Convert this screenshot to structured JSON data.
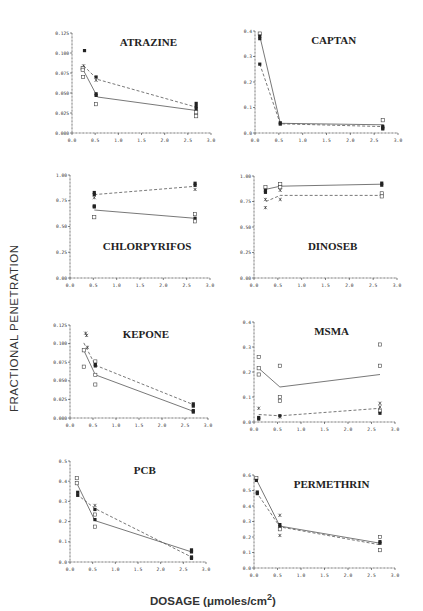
{
  "figure": {
    "ylabel": "FRACTIONAL PENETRATION",
    "xlabel_prefix": "DOSAGE (",
    "xlabel_unit": "μmoles/cm",
    "xlabel_sup": "2",
    "xlabel_suffix": ")"
  },
  "chart_data": [
    {
      "type": "scatter",
      "title": "ATRAZINE",
      "xlabel": "DOSAGE (μmoles/cm2)",
      "ylabel": "FRACTIONAL PENETRATION",
      "xlim": [
        0,
        3.0
      ],
      "ylim": [
        0,
        0.125
      ],
      "xticks": [
        "0.0",
        "0.5",
        "1.0",
        "1.5",
        "2.0",
        "2.5",
        "3.0"
      ],
      "yticks": [
        "0.000",
        "0.025",
        "0.050",
        "0.075",
        "0.100",
        "0.125"
      ],
      "title_pos": "top",
      "series": [
        {
          "name": "solid",
          "style": "solid",
          "x": [
            0.25,
            0.55,
            2.7
          ],
          "y": [
            0.078,
            0.045,
            0.028
          ]
        },
        {
          "name": "dashed",
          "style": "dashed",
          "x": [
            0.25,
            0.55,
            2.7
          ],
          "y": [
            0.084,
            0.067,
            0.032
          ]
        }
      ],
      "points": [
        {
          "x": 0.27,
          "y": 0.103,
          "m": "filled"
        },
        {
          "x": 0.25,
          "y": 0.084,
          "m": "star"
        },
        {
          "x": 0.23,
          "y": 0.081,
          "m": "open"
        },
        {
          "x": 0.23,
          "y": 0.079,
          "m": "open"
        },
        {
          "x": 0.24,
          "y": 0.07,
          "m": "open"
        },
        {
          "x": 0.52,
          "y": 0.07,
          "m": "filled"
        },
        {
          "x": 0.52,
          "y": 0.066,
          "m": "star"
        },
        {
          "x": 0.52,
          "y": 0.049,
          "m": "filled"
        },
        {
          "x": 0.52,
          "y": 0.047,
          "m": "filled"
        },
        {
          "x": 0.52,
          "y": 0.036,
          "m": "open"
        },
        {
          "x": 2.68,
          "y": 0.037,
          "m": "filled"
        },
        {
          "x": 2.68,
          "y": 0.033,
          "m": "filled"
        },
        {
          "x": 2.68,
          "y": 0.03,
          "m": "filled"
        },
        {
          "x": 2.68,
          "y": 0.026,
          "m": "open"
        },
        {
          "x": 2.68,
          "y": 0.021,
          "m": "open"
        }
      ]
    },
    {
      "type": "scatter",
      "title": "CAPTAN",
      "xlim": [
        0,
        3.0
      ],
      "ylim": [
        0,
        0.4
      ],
      "xticks": [
        "0.0",
        "0.5",
        "1.0",
        "1.5",
        "2.0",
        "2.5",
        "3.0"
      ],
      "yticks": [
        "0.0",
        "0.1",
        "0.2",
        "0.3",
        "0.4"
      ],
      "title_pos": "top",
      "series": [
        {
          "name": "solid",
          "style": "solid",
          "x": [
            0.1,
            0.53,
            2.7
          ],
          "y": [
            0.38,
            0.038,
            0.032
          ]
        },
        {
          "name": "dashed",
          "style": "dashed",
          "x": [
            0.1,
            0.53,
            2.7
          ],
          "y": [
            0.27,
            0.036,
            0.025
          ]
        }
      ],
      "points": [
        {
          "x": 0.1,
          "y": 0.39,
          "m": "open"
        },
        {
          "x": 0.1,
          "y": 0.38,
          "m": "filled"
        },
        {
          "x": 0.1,
          "y": 0.37,
          "m": "filled"
        },
        {
          "x": 0.1,
          "y": 0.27,
          "m": "filled"
        },
        {
          "x": 0.53,
          "y": 0.04,
          "m": "filled"
        },
        {
          "x": 0.53,
          "y": 0.035,
          "m": "filled"
        },
        {
          "x": 2.68,
          "y": 0.05,
          "m": "open"
        },
        {
          "x": 2.68,
          "y": 0.026,
          "m": "filled"
        },
        {
          "x": 2.68,
          "y": 0.02,
          "m": "filled"
        },
        {
          "x": 2.68,
          "y": 0.016,
          "m": "filled"
        }
      ]
    },
    {
      "type": "scatter",
      "title": "CHLORPYRIFOS",
      "xlim": [
        0,
        3.0
      ],
      "ylim": [
        0,
        1.0
      ],
      "xticks": [
        "0.0",
        "0.5",
        "1.0",
        "1.5",
        "2.0",
        "2.5",
        "3.0"
      ],
      "yticks": [
        "0.00",
        "0.25",
        "0.50",
        "0.75",
        "1.00"
      ],
      "title_pos": "middle",
      "series": [
        {
          "name": "solid",
          "style": "solid",
          "x": [
            0.52,
            2.68
          ],
          "y": [
            0.66,
            0.58
          ]
        },
        {
          "name": "dashed",
          "style": "dashed",
          "x": [
            0.52,
            2.68
          ],
          "y": [
            0.81,
            0.89
          ]
        }
      ],
      "points": [
        {
          "x": 0.52,
          "y": 0.83,
          "m": "filled"
        },
        {
          "x": 0.52,
          "y": 0.81,
          "m": "filled"
        },
        {
          "x": 0.52,
          "y": 0.78,
          "m": "star"
        },
        {
          "x": 0.52,
          "y": 0.7,
          "m": "filled"
        },
        {
          "x": 0.52,
          "y": 0.69,
          "m": "filled"
        },
        {
          "x": 0.52,
          "y": 0.59,
          "m": "open"
        },
        {
          "x": 2.68,
          "y": 0.92,
          "m": "filled"
        },
        {
          "x": 2.68,
          "y": 0.9,
          "m": "filled"
        },
        {
          "x": 2.68,
          "y": 0.86,
          "m": "star"
        },
        {
          "x": 2.68,
          "y": 0.62,
          "m": "open"
        },
        {
          "x": 2.68,
          "y": 0.58,
          "m": "filled"
        },
        {
          "x": 2.68,
          "y": 0.55,
          "m": "open"
        }
      ]
    },
    {
      "type": "scatter",
      "title": "DINOSEB",
      "xlim": [
        0,
        3.0
      ],
      "ylim": [
        0,
        1.0
      ],
      "xticks": [
        "0.0",
        "0.5",
        "1.0",
        "1.5",
        "2.0",
        "2.5",
        "3.0"
      ],
      "yticks": [
        "0.00",
        "0.25",
        "0.50",
        "0.75",
        "1.00"
      ],
      "title_pos": "middle",
      "series": [
        {
          "name": "solid",
          "style": "solid",
          "x": [
            0.25,
            0.55,
            2.68
          ],
          "y": [
            0.87,
            0.9,
            0.92
          ]
        },
        {
          "name": "dashed",
          "style": "dashed",
          "x": [
            0.25,
            0.55,
            2.68
          ],
          "y": [
            0.75,
            0.81,
            0.81
          ]
        }
      ],
      "points": [
        {
          "x": 0.24,
          "y": 0.89,
          "m": "open"
        },
        {
          "x": 0.24,
          "y": 0.86,
          "m": "filled"
        },
        {
          "x": 0.24,
          "y": 0.84,
          "m": "filled"
        },
        {
          "x": 0.24,
          "y": 0.77,
          "m": "star"
        },
        {
          "x": 0.24,
          "y": 0.69,
          "m": "star"
        },
        {
          "x": 0.55,
          "y": 0.92,
          "m": "open"
        },
        {
          "x": 0.55,
          "y": 0.89,
          "m": "open"
        },
        {
          "x": 0.55,
          "y": 0.86,
          "m": "star"
        },
        {
          "x": 0.55,
          "y": 0.77,
          "m": "star"
        },
        {
          "x": 2.68,
          "y": 0.93,
          "m": "filled"
        },
        {
          "x": 2.68,
          "y": 0.91,
          "m": "filled"
        },
        {
          "x": 2.68,
          "y": 0.83,
          "m": "open"
        },
        {
          "x": 2.68,
          "y": 0.8,
          "m": "open"
        }
      ]
    },
    {
      "type": "scatter",
      "title": "KEPONE",
      "xlim": [
        0,
        3.0
      ],
      "ylim": [
        0,
        0.125
      ],
      "xticks": [
        "0.0",
        "0.5",
        "1.0",
        "1.5",
        "2.0",
        "2.5",
        "3.0"
      ],
      "yticks": [
        "0.000",
        "0.025",
        "0.050",
        "0.075",
        "0.100",
        "0.125"
      ],
      "title_pos": "top",
      "series": [
        {
          "name": "solid",
          "style": "solid",
          "x": [
            0.3,
            0.55,
            2.68
          ],
          "y": [
            0.091,
            0.058,
            0.009
          ]
        },
        {
          "name": "dashed",
          "style": "dashed",
          "x": [
            0.3,
            0.55,
            2.68
          ],
          "y": [
            0.101,
            0.071,
            0.018
          ]
        }
      ],
      "points": [
        {
          "x": 0.34,
          "y": 0.114,
          "m": "star"
        },
        {
          "x": 0.36,
          "y": 0.111,
          "m": "star"
        },
        {
          "x": 0.38,
          "y": 0.095,
          "m": "star"
        },
        {
          "x": 0.3,
          "y": 0.091,
          "m": "open"
        },
        {
          "x": 0.3,
          "y": 0.069,
          "m": "open"
        },
        {
          "x": 0.55,
          "y": 0.076,
          "m": "open"
        },
        {
          "x": 0.55,
          "y": 0.072,
          "m": "filled"
        },
        {
          "x": 0.55,
          "y": 0.07,
          "m": "filled"
        },
        {
          "x": 0.55,
          "y": 0.058,
          "m": "open"
        },
        {
          "x": 0.55,
          "y": 0.045,
          "m": "open"
        },
        {
          "x": 2.68,
          "y": 0.019,
          "m": "filled"
        },
        {
          "x": 2.68,
          "y": 0.016,
          "m": "filled"
        },
        {
          "x": 2.68,
          "y": 0.01,
          "m": "filled"
        },
        {
          "x": 2.68,
          "y": 0.008,
          "m": "filled"
        }
      ]
    },
    {
      "type": "scatter",
      "title": "MSMA",
      "xlim": [
        0,
        3.0
      ],
      "ylim": [
        0,
        0.4
      ],
      "xticks": [
        "0.0",
        "0.5",
        "1.0",
        "1.5",
        "2.0",
        "2.5",
        "3.0"
      ],
      "yticks": [
        "0.0",
        "0.1",
        "0.2",
        "0.3",
        "0.4"
      ],
      "title_pos": "top",
      "series": [
        {
          "name": "solid",
          "style": "solid",
          "x": [
            0.1,
            0.55,
            2.68
          ],
          "y": [
            0.215,
            0.14,
            0.19
          ]
        },
        {
          "name": "dashed",
          "style": "dashed",
          "x": [
            0.1,
            0.55,
            2.68
          ],
          "y": [
            0.03,
            0.025,
            0.055
          ]
        }
      ],
      "points": [
        {
          "x": 0.1,
          "y": 0.26,
          "m": "open"
        },
        {
          "x": 0.1,
          "y": 0.215,
          "m": "open"
        },
        {
          "x": 0.1,
          "y": 0.19,
          "m": "open"
        },
        {
          "x": 0.1,
          "y": 0.055,
          "m": "star"
        },
        {
          "x": 0.1,
          "y": 0.018,
          "m": "filled"
        },
        {
          "x": 0.1,
          "y": 0.012,
          "m": "filled"
        },
        {
          "x": 0.55,
          "y": 0.225,
          "m": "open"
        },
        {
          "x": 0.55,
          "y": 0.1,
          "m": "open"
        },
        {
          "x": 0.55,
          "y": 0.085,
          "m": "open"
        },
        {
          "x": 0.55,
          "y": 0.025,
          "m": "filled"
        },
        {
          "x": 0.55,
          "y": 0.02,
          "m": "star"
        },
        {
          "x": 2.68,
          "y": 0.31,
          "m": "open"
        },
        {
          "x": 2.68,
          "y": 0.225,
          "m": "open"
        },
        {
          "x": 2.68,
          "y": 0.075,
          "m": "star"
        },
        {
          "x": 2.68,
          "y": 0.06,
          "m": "star"
        },
        {
          "x": 2.68,
          "y": 0.045,
          "m": "open"
        },
        {
          "x": 2.68,
          "y": 0.035,
          "m": "filled"
        }
      ]
    },
    {
      "type": "scatter",
      "title": "PCB",
      "xlim": [
        0,
        3.0
      ],
      "ylim": [
        0,
        0.5
      ],
      "xticks": [
        "0.0",
        "0.5",
        "1.0",
        "1.5",
        "2.0",
        "2.5",
        "3.0"
      ],
      "yticks": [
        "0.0",
        "0.1",
        "0.2",
        "0.3",
        "0.4",
        "0.5"
      ],
      "title_pos": "top",
      "series": [
        {
          "name": "solid",
          "style": "solid",
          "x": [
            0.15,
            0.55,
            2.68
          ],
          "y": [
            0.39,
            0.205,
            0.05
          ]
        },
        {
          "name": "dashed",
          "style": "dashed",
          "x": [
            0.15,
            0.55,
            2.68
          ],
          "y": [
            0.335,
            0.265,
            0.025
          ]
        }
      ],
      "points": [
        {
          "x": 0.15,
          "y": 0.415,
          "m": "open"
        },
        {
          "x": 0.15,
          "y": 0.39,
          "m": "open"
        },
        {
          "x": 0.17,
          "y": 0.345,
          "m": "filled"
        },
        {
          "x": 0.17,
          "y": 0.33,
          "m": "filled"
        },
        {
          "x": 0.55,
          "y": 0.28,
          "m": "star"
        },
        {
          "x": 0.55,
          "y": 0.26,
          "m": "filled"
        },
        {
          "x": 0.55,
          "y": 0.235,
          "m": "open"
        },
        {
          "x": 0.55,
          "y": 0.21,
          "m": "filled"
        },
        {
          "x": 0.55,
          "y": 0.175,
          "m": "open"
        },
        {
          "x": 2.68,
          "y": 0.06,
          "m": "filled"
        },
        {
          "x": 2.68,
          "y": 0.05,
          "m": "filled"
        },
        {
          "x": 2.68,
          "y": 0.025,
          "m": "filled"
        },
        {
          "x": 2.68,
          "y": 0.018,
          "m": "filled"
        }
      ]
    },
    {
      "type": "scatter",
      "title": "PERMETHRIN",
      "xlim": [
        0,
        3.0
      ],
      "ylim": [
        0,
        0.6
      ],
      "xticks": [
        "0.0",
        "0.5",
        "1.0",
        "1.5",
        "2.0",
        "2.5",
        "3.0"
      ],
      "yticks": [
        "0.0",
        "0.1",
        "0.2",
        "0.3",
        "0.4",
        "0.5",
        "0.6"
      ],
      "title_pos": "top",
      "series": [
        {
          "name": "solid",
          "style": "solid",
          "x": [
            0.05,
            0.55,
            2.68
          ],
          "y": [
            0.57,
            0.27,
            0.16
          ]
        },
        {
          "name": "dashed",
          "style": "dashed",
          "x": [
            0.05,
            0.55,
            2.68
          ],
          "y": [
            0.49,
            0.265,
            0.15
          ]
        }
      ],
      "points": [
        {
          "x": 0.05,
          "y": 0.58,
          "m": "open"
        },
        {
          "x": 0.05,
          "y": 0.565,
          "m": "filled"
        },
        {
          "x": 0.07,
          "y": 0.49,
          "m": "filled"
        },
        {
          "x": 0.07,
          "y": 0.48,
          "m": "filled"
        },
        {
          "x": 0.55,
          "y": 0.34,
          "m": "star"
        },
        {
          "x": 0.55,
          "y": 0.28,
          "m": "filled"
        },
        {
          "x": 0.55,
          "y": 0.265,
          "m": "filled"
        },
        {
          "x": 0.55,
          "y": 0.25,
          "m": "open"
        },
        {
          "x": 0.55,
          "y": 0.21,
          "m": "star"
        },
        {
          "x": 2.68,
          "y": 0.2,
          "m": "open"
        },
        {
          "x": 2.68,
          "y": 0.17,
          "m": "filled"
        },
        {
          "x": 2.68,
          "y": 0.16,
          "m": "filled"
        },
        {
          "x": 2.68,
          "y": 0.115,
          "m": "open"
        }
      ]
    }
  ]
}
